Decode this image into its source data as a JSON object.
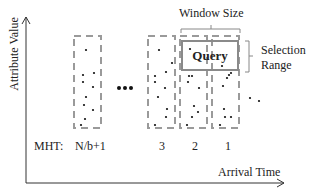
{
  "diagram": {
    "axes": {
      "y_label": "Attribute Value",
      "x_label": "Arrival Time"
    },
    "annotations": {
      "window_size": "Window Size",
      "selection_range_line1": "Selection",
      "selection_range_line2": "Range",
      "query": "Query",
      "ellipsis": "•••"
    },
    "mht": {
      "label": "MHT:",
      "windows": [
        {
          "label": "N/b+1"
        },
        {
          "label": "3"
        },
        {
          "label": "2"
        },
        {
          "label": "1"
        }
      ]
    },
    "colors": {
      "dash_box": "#9a9a9a",
      "query_border": "#8a8a8a",
      "axis": "#333333",
      "point": "#111111"
    }
  }
}
